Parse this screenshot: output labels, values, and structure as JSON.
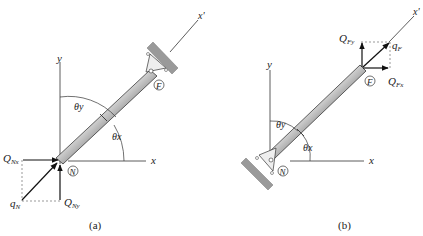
{
  "figure": {
    "panel_a": {
      "caption": "(a)",
      "axis_x": "x",
      "axis_y": "y",
      "axis_xprime": "x'",
      "theta_x": "θx",
      "theta_y": "θy",
      "node_near": "N",
      "node_far": "F",
      "force_x_label": "Q",
      "force_x_sub": "Nx",
      "force_y_label": "Q",
      "force_y_sub": "Ny",
      "resultant_label": "q",
      "resultant_sub": "N",
      "support_end": "F"
    },
    "panel_b": {
      "caption": "(b)",
      "axis_x": "x",
      "axis_y": "y",
      "axis_xprime": "x'",
      "theta_x": "θx",
      "theta_y": "θy",
      "node_near": "N",
      "node_far": "F",
      "force_x_label": "Q",
      "force_x_sub": "Fx",
      "force_y_label": "Q",
      "force_y_sub": "Fy",
      "resultant_label": "q",
      "resultant_sub": "F",
      "support_end": "N"
    },
    "colors": {
      "line": "#222222",
      "support": "#9a9a9a",
      "member_dark": "#3a3a3a",
      "member_light": "#d8d8d8"
    }
  }
}
